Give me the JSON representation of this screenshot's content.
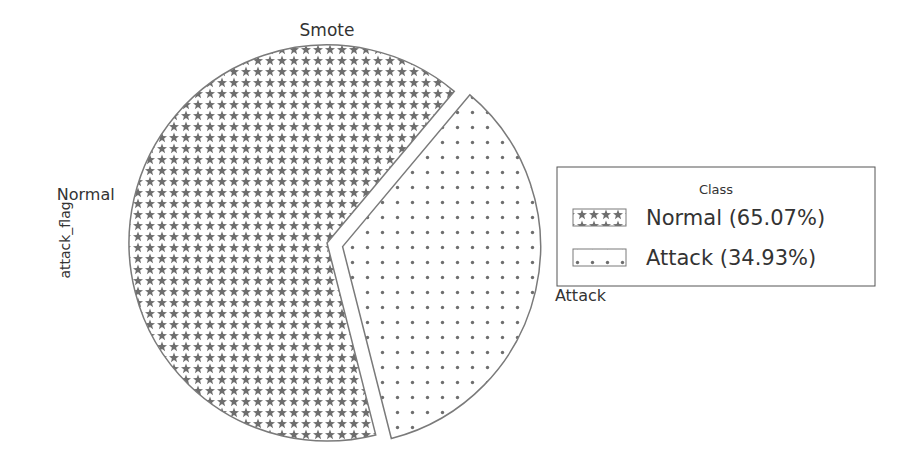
{
  "chart_data": {
    "type": "pie",
    "title": "Smote",
    "ylabel": "attack_flag",
    "slices": [
      {
        "label": "Normal",
        "value": 65.07,
        "legend": "Normal (65.07%)",
        "pattern": "stars",
        "exploded": false
      },
      {
        "label": "Attack",
        "value": 34.93,
        "legend": "Attack (34.93%)",
        "pattern": "dots",
        "exploded": true
      }
    ],
    "start_angle_deg": 50,
    "direction": "counterclockwise",
    "legend": {
      "title": "Class",
      "placement": "right"
    },
    "colors": {
      "edge": "#7a7a7a",
      "hatch": "#6e6e6e",
      "text": "#333333",
      "background": "#ffffff"
    }
  }
}
